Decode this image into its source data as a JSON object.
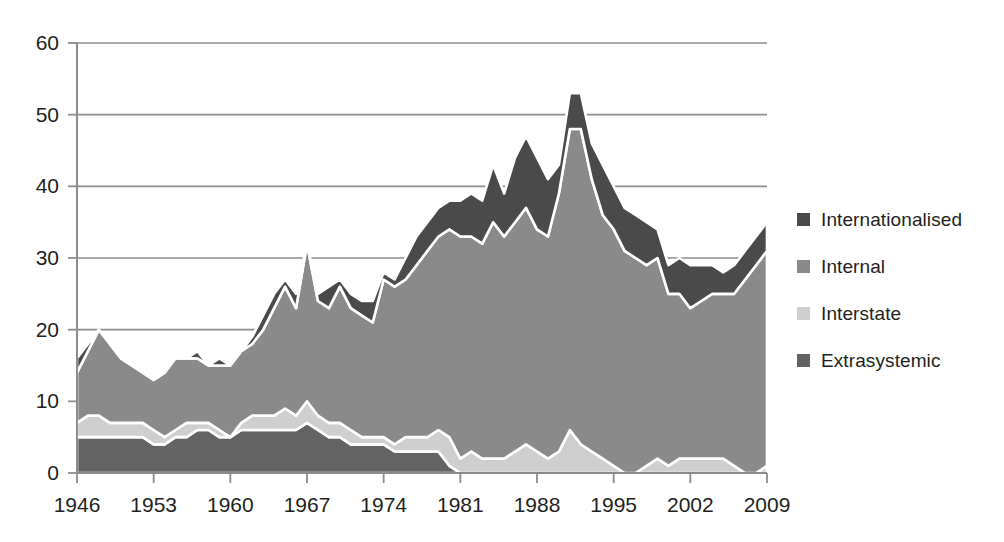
{
  "legend": {
    "position": "right",
    "items": [
      {
        "label": "Internationalised",
        "color": "#4a4a4a",
        "name": "legend-item-internationalised"
      },
      {
        "label": "Internal",
        "color": "#8a8a8a",
        "name": "legend-item-internal"
      },
      {
        "label": "Interstate",
        "color": "#cfcfcf",
        "name": "legend-item-interstate"
      },
      {
        "label": "Extrasystemic",
        "color": "#636363",
        "name": "legend-item-extrasystemic"
      }
    ]
  },
  "axes": {
    "y_ticks": [
      "0",
      "10",
      "20",
      "30",
      "40",
      "50",
      "60"
    ],
    "x_ticks": [
      "1946",
      "1953",
      "1960",
      "1967",
      "1974",
      "1981",
      "1988",
      "1995",
      "2002",
      "2009"
    ]
  },
  "chart_data": {
    "type": "area",
    "title": "",
    "subtitle": "",
    "xlabel": "",
    "ylabel": "",
    "xlim": [
      1946,
      2009
    ],
    "ylim": [
      0,
      60
    ],
    "ytick_interval": 10,
    "xtick_interval": 7,
    "grid": true,
    "stacked": true,
    "stack_order_bottom_to_top": [
      "Extrasystemic",
      "Interstate",
      "Internal",
      "Internationalised"
    ],
    "x": [
      1946,
      1947,
      1948,
      1949,
      1950,
      1951,
      1952,
      1953,
      1954,
      1955,
      1956,
      1957,
      1958,
      1959,
      1960,
      1961,
      1962,
      1963,
      1964,
      1965,
      1966,
      1967,
      1968,
      1969,
      1970,
      1971,
      1972,
      1973,
      1974,
      1975,
      1976,
      1977,
      1978,
      1979,
      1980,
      1981,
      1982,
      1983,
      1984,
      1985,
      1986,
      1987,
      1988,
      1989,
      1990,
      1991,
      1992,
      1993,
      1994,
      1995,
      1996,
      1997,
      1998,
      1999,
      2000,
      2001,
      2002,
      2003,
      2004,
      2005,
      2006,
      2007,
      2008,
      2009
    ],
    "series": [
      {
        "name": "Extrasystemic",
        "color": "#636363",
        "values": [
          5,
          5,
          5,
          5,
          5,
          5,
          5,
          4,
          4,
          5,
          5,
          6,
          6,
          5,
          5,
          6,
          6,
          6,
          6,
          6,
          6,
          7,
          6,
          5,
          5,
          4,
          4,
          4,
          4,
          3,
          3,
          3,
          3,
          3,
          1,
          0,
          0,
          0,
          0,
          0,
          0,
          0,
          0,
          0,
          0,
          0,
          0,
          0,
          0,
          0,
          0,
          0,
          0,
          0,
          0,
          0,
          0,
          0,
          0,
          0,
          0,
          0,
          0,
          0
        ]
      },
      {
        "name": "Interstate",
        "color": "#cfcfcf",
        "values": [
          2,
          3,
          3,
          2,
          2,
          2,
          2,
          2,
          1,
          1,
          2,
          1,
          1,
          1,
          0,
          1,
          2,
          2,
          2,
          3,
          2,
          3,
          2,
          2,
          2,
          2,
          1,
          1,
          1,
          1,
          2,
          2,
          2,
          3,
          4,
          2,
          3,
          2,
          2,
          2,
          3,
          4,
          3,
          2,
          3,
          6,
          4,
          3,
          2,
          1,
          0,
          0,
          1,
          2,
          1,
          2,
          2,
          2,
          2,
          2,
          1,
          0,
          0,
          1
        ]
      },
      {
        "name": "Internal",
        "color": "#8a8a8a",
        "values": [
          7,
          9,
          12,
          11,
          9,
          8,
          7,
          7,
          9,
          10,
          9,
          9,
          8,
          9,
          10,
          10,
          10,
          12,
          15,
          17,
          15,
          22,
          16,
          16,
          19,
          17,
          17,
          16,
          22,
          22,
          22,
          24,
          26,
          27,
          29,
          31,
          30,
          30,
          33,
          31,
          32,
          33,
          31,
          31,
          36,
          42,
          44,
          38,
          34,
          33,
          31,
          30,
          28,
          28,
          24,
          23,
          21,
          22,
          23,
          23,
          24,
          27,
          29,
          30
        ]
      },
      {
        "name": "Internationalised",
        "color": "#4a4a4a",
        "values": [
          2,
          1,
          0,
          0,
          0,
          0,
          0,
          0,
          0,
          0,
          0,
          1,
          0,
          1,
          0,
          0,
          1,
          2,
          2,
          1,
          2,
          0,
          1,
          3,
          1,
          2,
          2,
          3,
          1,
          1,
          3,
          4,
          4,
          4,
          4,
          5,
          6,
          6,
          8,
          6,
          9,
          10,
          10,
          8,
          4,
          5,
          5,
          5,
          7,
          6,
          6,
          6,
          6,
          4,
          4,
          5,
          6,
          5,
          4,
          3,
          4,
          4,
          4,
          4
        ]
      }
    ]
  }
}
